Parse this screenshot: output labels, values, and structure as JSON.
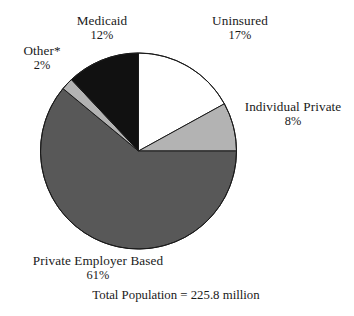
{
  "chart_data": {
    "type": "pie",
    "title": "",
    "subtitle": "",
    "xlabel": "",
    "ylabel": "",
    "legend_position": "outside-labels",
    "grid": false,
    "units": "percent",
    "total_label": "Total Population = 225.8 million",
    "total_value": 225.8,
    "total_units": "million",
    "footnote_marker": "*",
    "categories": [
      "Uninsured",
      "Individual Private",
      "Private Employer Based",
      "Other*",
      "Medicaid"
    ],
    "values": [
      17,
      8,
      61,
      2,
      12
    ],
    "slices": [
      {
        "label": "Uninsured",
        "value": 17,
        "value_text": "17%",
        "color": "#ffffff",
        "start_angle_deg": 0,
        "sweep_deg": 61.2
      },
      {
        "label": "Individual Private",
        "value": 8,
        "value_text": "8%",
        "color": "#b3b3b3",
        "start_angle_deg": 61.2,
        "sweep_deg": 28.8
      },
      {
        "label": "Private Employer Based",
        "value": 61,
        "value_text": "61%",
        "color": "#585858",
        "start_angle_deg": 90,
        "sweep_deg": 219.6
      },
      {
        "label": "Other*",
        "value": 2,
        "value_text": "2%",
        "color": "#b3b3b3",
        "start_angle_deg": 309.6,
        "sweep_deg": 7.2
      },
      {
        "label": "Medicaid",
        "value": 12,
        "value_text": "12%",
        "color": "#111111",
        "start_angle_deg": 316.8,
        "sweep_deg": 43.2
      }
    ],
    "geometry": {
      "center_x": 138.5,
      "center_y": 151,
      "radius": 98,
      "outline_color": "#1a1a1a",
      "outline_width": 1
    }
  },
  "labels": {
    "medicaid": {
      "name": "Medicaid",
      "pct": "12%"
    },
    "uninsured": {
      "name": "Uninsured",
      "pct": "17%"
    },
    "other": {
      "name": "Other*",
      "pct": "2%"
    },
    "individual_private": {
      "name": "Individual Private",
      "pct": "8%"
    },
    "private_employer": {
      "name": "Private Employer Based",
      "pct": "61%"
    }
  },
  "footer": {
    "total_population": "Total Population = 225.8 million"
  },
  "colors": {
    "background": "#ffffff",
    "text": "#1a1a1a",
    "slice_white": "#ffffff",
    "slice_light_gray": "#b3b3b3",
    "slice_mid_gray": "#585858",
    "slice_black": "#111111",
    "outline": "#1a1a1a"
  }
}
